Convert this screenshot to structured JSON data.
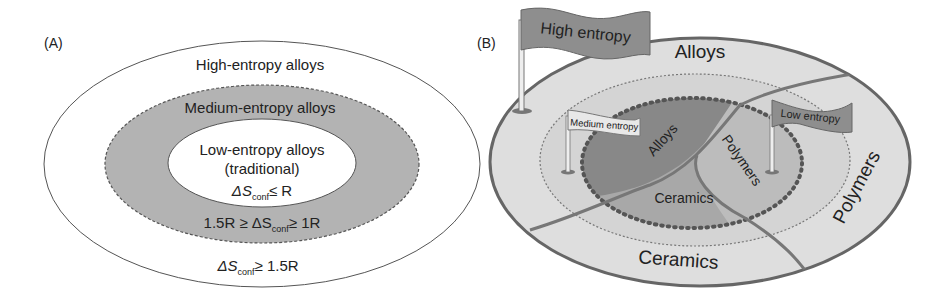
{
  "panel_a": {
    "label": "(A)",
    "outer": {
      "title": "High-entropy alloys",
      "condition_prefix": "ΔS",
      "condition_sub": "conf",
      "condition_suffix": "≥ 1.5R"
    },
    "middle": {
      "title": "Medium-entropy alloys",
      "condition_prefix": "1.5R ≥ ΔS",
      "condition_sub": "conf",
      "condition_suffix": "≥ 1R"
    },
    "inner": {
      "title": "Low-entropy alloys",
      "subtitle": "(traditional)",
      "condition_prefix": "ΔS",
      "condition_sub": "conf",
      "condition_suffix": "≤ R"
    }
  },
  "panel_b": {
    "label": "(B)",
    "flags": {
      "high": "High entropy",
      "medium": "Medium entropy",
      "low": "Low entropy"
    },
    "outer_regions": {
      "alloys": "Alloys",
      "polymers": "Polymers",
      "ceramics": "Ceramics"
    },
    "inner_regions": {
      "alloys": "Alloys",
      "polymers": "Polymers",
      "ceramics": "Ceramics"
    }
  },
  "colors": {
    "outer_fill": "#dcdcdc",
    "medium_fill": "#a9a9a9",
    "inner_alloys": "#8a8a8a",
    "inner_polymers": "#b9b9b9",
    "inner_ceramics": "#a5a5a5",
    "flag_dark": "#8c8c8c",
    "flag_light": "#e6e6e6",
    "stroke": "#666666"
  }
}
